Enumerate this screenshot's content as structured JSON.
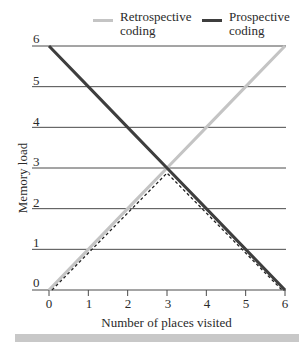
{
  "legend": {
    "retrospective": {
      "line1": "Retrospective",
      "line2": "coding",
      "color": "#c4c4c4"
    },
    "prospective": {
      "line1": "Prospective",
      "line2": "coding",
      "color": "#3e3e3e"
    }
  },
  "axes": {
    "xlabel": "Number of places visited",
    "ylabel": "Memory load",
    "xticks": [
      "0",
      "1",
      "2",
      "3",
      "4",
      "5",
      "6"
    ],
    "yticks": [
      "0",
      "1",
      "2",
      "3",
      "4",
      "5",
      "6"
    ]
  },
  "chart_data": {
    "type": "line",
    "title": "",
    "xlabel": "Number of places visited",
    "ylabel": "Memory load",
    "x": [
      0,
      1,
      2,
      3,
      4,
      5,
      6
    ],
    "xlim": [
      0,
      6
    ],
    "ylim": [
      0,
      6
    ],
    "grid": "horizontal",
    "legend_position": "top",
    "series": [
      {
        "name": "Retrospective coding",
        "values": [
          0,
          1,
          2,
          3,
          4,
          5,
          6
        ],
        "color": "#c4c4c4",
        "style": "solid"
      },
      {
        "name": "Prospective coding",
        "values": [
          6,
          5,
          4,
          3,
          2,
          1,
          0
        ],
        "color": "#3e3e3e",
        "style": "solid"
      },
      {
        "name": "Optimal (min of both)",
        "values": [
          0,
          1,
          2,
          3,
          2,
          1,
          0
        ],
        "color": "#222222",
        "style": "dashed",
        "legend": false
      }
    ]
  }
}
